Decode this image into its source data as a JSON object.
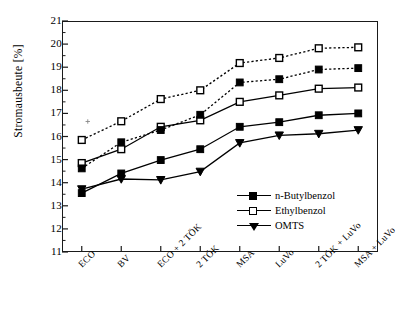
{
  "chart_data": {
    "type": "line",
    "title": "",
    "xlabel": "",
    "ylabel": "Stromausbeute [%]",
    "ylim": [
      11,
      21
    ],
    "ytick_step": 1,
    "yticks": [
      "11",
      "12",
      "13",
      "14",
      "15",
      "16",
      "17",
      "18",
      "19",
      "20",
      "21"
    ],
    "minor_ticks": true,
    "grid": false,
    "legend_position": "lower-right",
    "categories": [
      "ECO",
      "BV",
      "ECO + 2 TÖK",
      "2 TÖK",
      "MSA",
      "LuVo",
      "2 TÖK + LuVo",
      "MSA + LuVo"
    ],
    "series": [
      {
        "name": "n-Butylbenzol",
        "marker": "filled-square",
        "linestyle": "solid",
        "values": [
          13.55,
          14.4,
          14.98,
          15.45,
          16.42,
          16.62,
          16.92,
          17.0
        ]
      },
      {
        "name": "Ethylbenzol",
        "marker": "open-square",
        "linestyle": "solid",
        "values": [
          14.85,
          15.45,
          16.42,
          16.7,
          17.5,
          17.78,
          18.07,
          18.12
        ]
      },
      {
        "name": "OMTS",
        "marker": "filled-triangle-down",
        "linestyle": "solid",
        "values": [
          13.72,
          14.16,
          14.12,
          14.48,
          15.72,
          16.05,
          16.12,
          16.28
        ]
      },
      {
        "name": "n-Butylbenzol (dotted)",
        "marker": "filled-square",
        "linestyle": "dotted",
        "values": [
          14.62,
          15.75,
          16.28,
          16.94,
          18.34,
          18.48,
          18.9,
          18.96
        ]
      },
      {
        "name": "Ethylbenzol (dotted)",
        "marker": "open-square",
        "linestyle": "dotted",
        "values": [
          15.85,
          16.66,
          17.62,
          18.0,
          19.18,
          19.4,
          19.82,
          19.86
        ]
      }
    ],
    "stray_marks": [
      {
        "category": "ECO",
        "value": 16.65,
        "note": "small artifact dot"
      }
    ]
  },
  "legend": {
    "entries": [
      {
        "label": "n-Butylbenzol",
        "marker": "filled-square"
      },
      {
        "label": "Ethylbenzol",
        "marker": "open-square"
      },
      {
        "label": "OMTS",
        "marker": "filled-triangle-down"
      }
    ]
  },
  "colors": {
    "line": "#000000",
    "axis": "#1a1a1a",
    "background": "#ffffff"
  }
}
